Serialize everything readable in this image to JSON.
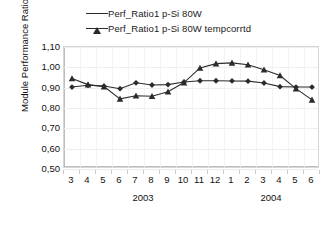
{
  "chart_data": {
    "type": "line",
    "title": "",
    "xlabel": "",
    "ylabel": "Module Performance Ratio",
    "ylim": [
      0.5,
      1.1
    ],
    "ytick_labels": [
      "1,10",
      "1,00",
      "0,90",
      "0,80",
      "0,70",
      "0,60",
      "0,50"
    ],
    "ytick_values": [
      1.1,
      1.0,
      0.9,
      0.8,
      0.7,
      0.6,
      0.5
    ],
    "grid": true,
    "legend_position": "top-center",
    "categories": [
      "3",
      "4",
      "5",
      "6",
      "7",
      "8",
      "9",
      "10",
      "11",
      "12",
      "1",
      "2",
      "3",
      "4",
      "5",
      "6"
    ],
    "group_labels": [
      {
        "label": "2003",
        "start_index": 0,
        "end_index": 9
      },
      {
        "label": "2004",
        "start_index": 10,
        "end_index": 15
      }
    ],
    "series": [
      {
        "name": "Perf_Ratio1 p-Si 80W",
        "marker": "triangle",
        "values": [
          0.945,
          0.915,
          0.905,
          0.845,
          0.86,
          0.858,
          0.88,
          0.925,
          0.997,
          1.018,
          1.022,
          1.013,
          0.988,
          0.96,
          0.895,
          0.84
        ]
      },
      {
        "name": "Perf_Ratio1 p-Si 80W tempcorrtd",
        "marker": "diamond",
        "values": [
          0.903,
          0.912,
          0.908,
          0.895,
          0.924,
          0.913,
          0.915,
          0.928,
          0.934,
          0.934,
          0.933,
          0.932,
          0.923,
          0.905,
          0.903,
          0.903
        ]
      }
    ]
  },
  "colors": {
    "series": "#2b2b2b",
    "grid": "#eeeeee",
    "axis": "#bdbdbd",
    "text": "#111111"
  }
}
